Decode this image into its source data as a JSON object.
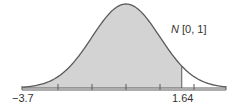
{
  "chart_data": {
    "type": "area",
    "title": "",
    "distribution_label": "N",
    "distribution_params": "[0, 1]",
    "xlabel": "",
    "ylabel": "",
    "xlim": [
      -3.7,
      3.7
    ],
    "tick_labels": [
      "-3.7",
      "1.64"
    ],
    "ticks": [
      -2,
      -1,
      0,
      1,
      2
    ],
    "shaded_region": {
      "from": -3.7,
      "to": 1.64,
      "color": "#d3d3d3"
    },
    "curve": "standard normal density",
    "grid": false,
    "legend": "none"
  },
  "labels": {
    "left": "−3.7",
    "right": "1.64",
    "dist_name": "N",
    "dist_params": " [0, 1]"
  },
  "colors": {
    "fill": "#d3d3d3",
    "stroke": "#5a5a5a"
  }
}
